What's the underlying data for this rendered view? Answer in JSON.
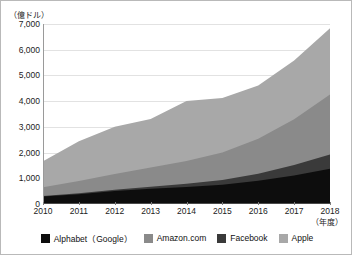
{
  "chart_data": {
    "type": "area",
    "stacked": true,
    "title": "",
    "subtitle": "",
    "xlabel": "（年度）",
    "ylabel": "（億ドル）",
    "unit_label": "（億ドル）",
    "x_axis_note": "（年度）",
    "categories": [
      "2010",
      "2011",
      "2012",
      "2013",
      "2014",
      "2015",
      "2016",
      "2017",
      "2018"
    ],
    "x": [
      2010,
      2011,
      2012,
      2013,
      2014,
      2015,
      2016,
      2017,
      2018
    ],
    "xlim": [
      2010,
      2018
    ],
    "ylim": [
      0,
      7000
    ],
    "ytick_labels": [
      "0",
      "1,000",
      "2,000",
      "3,000",
      "4,000",
      "5,000",
      "6,000",
      "7,000"
    ],
    "ytick_values": [
      0,
      1000,
      2000,
      3000,
      4000,
      5000,
      6000,
      7000
    ],
    "grid": true,
    "legend_position": "bottom",
    "series": [
      {
        "name": "Alphabet（Google）",
        "color": "#0d0d0d",
        "values": [
          293,
          380,
          502,
          595,
          660,
          750,
          903,
          1108,
          1368
        ]
      },
      {
        "name": "Facebook",
        "color": "#3a3a3a",
        "values": [
          20,
          37,
          51,
          78,
          125,
          179,
          276,
          406,
          558
        ]
      },
      {
        "name": "Amazon.com",
        "color": "#8a8a8a",
        "values": [
          342,
          481,
          610,
          745,
          889,
          1070,
          1360,
          1779,
          2329
        ]
      },
      {
        "name": "Apple",
        "color": "#a8a8a8",
        "values": [
          1005,
          1542,
          1845,
          1883,
          2330,
          2120,
          2072,
          2292,
          2580
        ]
      }
    ],
    "stack_totals": [
      1660,
      2440,
      3008,
      3301,
      4004,
      4119,
      4611,
      5585,
      6835
    ]
  },
  "legend": {
    "items": [
      {
        "label": "Alphabet（Google）",
        "color": "#0d0d0d"
      },
      {
        "label": "Amazon.com",
        "color": "#8a8a8a"
      },
      {
        "label": "Facebook",
        "color": "#3a3a3a"
      },
      {
        "label": "Apple",
        "color": "#a8a8a8"
      }
    ]
  }
}
